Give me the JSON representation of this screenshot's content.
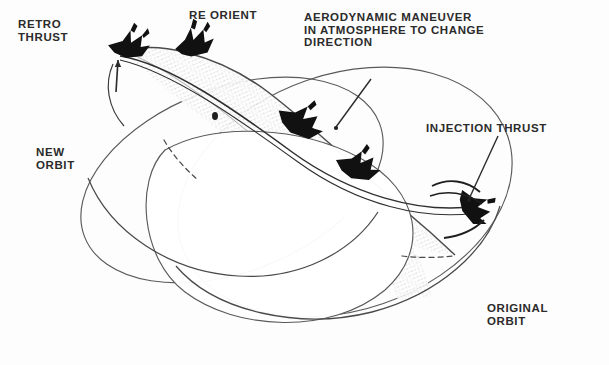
{
  "figure": {
    "background_color": "#fdfdfd",
    "ink_color": "#2b2b2b",
    "line_color": "#555555"
  },
  "labels": {
    "retro_thrust": "RETRO\nTHRUST",
    "re_orient": "RE ORIENT",
    "aerodynamic": "AERODYNAMIC MANEUVER\nIN ATMOSPHERE TO CHANGE\nDIRECTION",
    "injection_thrust": "INJECTION THRUST",
    "new_orbit": "NEW\nORBIT",
    "original_orbit": "ORIGINAL\nORBIT"
  },
  "diagram_elements": {
    "planet": "central-planet-body",
    "original_orbit_ellipse": "original-orbit-path",
    "new_orbit_ellipse": "new-orbit-path",
    "trajectory_band": "atmospheric-entry-trajectory-band",
    "spacecraft": [
      {
        "name": "spacecraft-retro-thrust",
        "x": 128,
        "y": 45
      },
      {
        "name": "spacecraft-re-orient",
        "x": 192,
        "y": 42
      },
      {
        "name": "spacecraft-aero-maneuver",
        "x": 300,
        "y": 120
      },
      {
        "name": "spacecraft-midcourse",
        "x": 355,
        "y": 163
      },
      {
        "name": "spacecraft-injection-thrust",
        "x": 474,
        "y": 205
      }
    ],
    "leader_lines": [
      {
        "name": "leader-aerodynamic",
        "from": [
          370,
          80
        ],
        "to": [
          335,
          128
        ]
      },
      {
        "name": "leader-injection-thrust",
        "from": [
          497,
          137
        ],
        "to": [
          470,
          198
        ]
      }
    ],
    "hidden_segments": [
      {
        "name": "dashed-new-orbit-occluded",
        "from": [
          166,
          142
        ],
        "to": [
          196,
          178
        ]
      },
      {
        "name": "dashed-original-orbit-occluded",
        "from": [
          405,
          256
        ],
        "to": [
          448,
          258
        ]
      }
    ]
  }
}
